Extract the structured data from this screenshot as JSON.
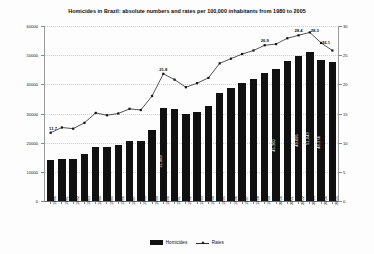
{
  "chart_data": {
    "type": "bar",
    "title": "Homicides in Brazil: absolute numbers and rates per 100,000 inhabitants from 1980 to 2005",
    "xlabel": "",
    "ylabel": "",
    "ylim": [
      0,
      60000
    ],
    "y2lim": [
      0,
      30
    ],
    "grid": true,
    "legend_position": "bottom",
    "categories": [
      "1980",
      "1981",
      "1982",
      "1983",
      "1984",
      "1985",
      "1986",
      "1987",
      "1988",
      "1989",
      "1990",
      "1991",
      "1992",
      "1993",
      "1994",
      "1995",
      "1996",
      "1997",
      "1998",
      "1999",
      "2000",
      "2001",
      "2002",
      "2003",
      "2004",
      "2005"
    ],
    "yticks": [
      "0",
      "10000",
      "20000",
      "30000",
      "40000",
      "50000",
      "60000"
    ],
    "y2ticks": [
      "0",
      "5",
      "10",
      "15",
      "20",
      "25",
      "30"
    ],
    "series": [
      {
        "name": "Homicides",
        "axis": "left",
        "type": "bar",
        "values": [
          13910,
          14400,
          14500,
          16100,
          18500,
          18600,
          19100,
          20500,
          20600,
          24200,
          31989,
          31630,
          30000,
          30600,
          32600,
          37100,
          38900,
          40500,
          41800,
          43900,
          45360,
          47900,
          49695,
          51043,
          48374,
          47578
        ]
      },
      {
        "name": "Rates",
        "axis": "right",
        "type": "line",
        "values": [
          11.7,
          12.6,
          12.4,
          13.4,
          15.1,
          14.7,
          15.0,
          15.8,
          15.6,
          18.0,
          21.8,
          20.8,
          19.5,
          20.2,
          21.1,
          23.6,
          24.4,
          25.2,
          25.8,
          26.7,
          26.9,
          27.9,
          28.4,
          28.9,
          27.1,
          25.8
        ]
      }
    ],
    "bar_labels": [
      {
        "index": 10,
        "text": "31.989"
      },
      {
        "index": 20,
        "text": "45.360"
      },
      {
        "index": 22,
        "text": "49.695"
      },
      {
        "index": 23,
        "text": "51.043"
      },
      {
        "index": 24,
        "text": "48.374"
      }
    ],
    "rate_labels": [
      {
        "index": 0,
        "text": "11.7"
      },
      {
        "index": 10,
        "text": "21.8"
      },
      {
        "index": 19,
        "text": "26.9"
      },
      {
        "index": 22,
        "text": "28.4"
      },
      {
        "index": 23,
        "text": "28.3"
      },
      {
        "index": 24,
        "text": "26.1"
      }
    ]
  },
  "legend": {
    "items": [
      {
        "label": "Homicides",
        "marker": "bar-swatch",
        "color": "#111111"
      },
      {
        "label": "Rates",
        "marker": "line-diamond-swatch",
        "color": "#1a1a1a"
      }
    ]
  },
  "colors": {
    "bar": "#111111",
    "line": "#2a2a2a",
    "axis": "#8a8a8a",
    "grid": "#cfcfcf",
    "text": "#111111",
    "background": "#fdfdfd"
  }
}
